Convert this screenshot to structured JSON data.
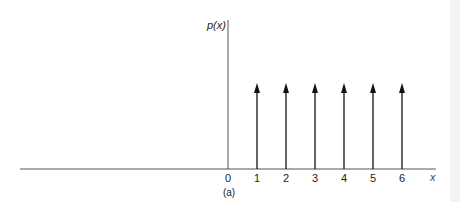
{
  "chart_data": {
    "type": "impulse",
    "title": "",
    "ylabel": "p(x)",
    "xlabel": "x",
    "caption": "(a)",
    "tick_labels": [
      "0",
      "1",
      "2",
      "3",
      "4",
      "5",
      "6"
    ],
    "x": [
      1,
      2,
      3,
      4,
      5,
      6
    ],
    "values": [
      1,
      1,
      1,
      1,
      1,
      1
    ],
    "impulse_style": "arrow",
    "grid": false,
    "legend": null
  },
  "colors": {
    "axis": "#333333",
    "impulse": "#111111",
    "background": "#ffffff"
  }
}
